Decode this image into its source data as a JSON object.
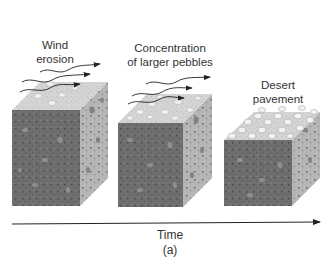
{
  "figure": {
    "panel_label": "(a)",
    "axis_label": "Time",
    "stages": [
      {
        "title_line1": "Wind",
        "title_line2": "erosion",
        "pebble_density": "sparse",
        "has_wind": true
      },
      {
        "title_line1": "Concentration",
        "title_line2": "of larger pebbles",
        "pebble_density": "medium",
        "has_wind": true
      },
      {
        "title_line1": "Desert",
        "title_line2": "pavement",
        "pebble_density": "dense",
        "has_wind": false
      }
    ]
  },
  "colors": {
    "front_face": "#6e6e6e",
    "side_face": "#b8b8b8",
    "top_face": "#d6d6d6",
    "pebble": "#efefef",
    "arrow": "#222222"
  }
}
